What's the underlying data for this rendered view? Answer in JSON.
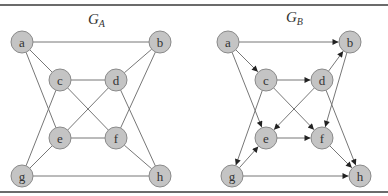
{
  "graphs": [
    {
      "id": "GA",
      "title": "G",
      "title_sub": "A",
      "directed": false,
      "title_pos": [
        88,
        24
      ],
      "nodes": [
        {
          "id": "a",
          "label": "a",
          "x": 22,
          "y": 42
        },
        {
          "id": "b",
          "label": "b",
          "x": 160,
          "y": 42
        },
        {
          "id": "c",
          "label": "c",
          "x": 60,
          "y": 80
        },
        {
          "id": "d",
          "label": "d",
          "x": 116,
          "y": 80
        },
        {
          "id": "e",
          "label": "e",
          "x": 60,
          "y": 138
        },
        {
          "id": "f",
          "label": "f",
          "x": 116,
          "y": 138
        },
        {
          "id": "g",
          "label": "g",
          "x": 22,
          "y": 176
        },
        {
          "id": "h",
          "label": "h",
          "x": 160,
          "y": 176
        }
      ],
      "edges": [
        [
          "a",
          "b"
        ],
        [
          "a",
          "c"
        ],
        [
          "a",
          "e"
        ],
        [
          "b",
          "d"
        ],
        [
          "b",
          "f"
        ],
        [
          "c",
          "d"
        ],
        [
          "c",
          "f"
        ],
        [
          "c",
          "g"
        ],
        [
          "d",
          "e"
        ],
        [
          "d",
          "h"
        ],
        [
          "e",
          "f"
        ],
        [
          "e",
          "g"
        ],
        [
          "f",
          "h"
        ],
        [
          "g",
          "h"
        ]
      ]
    },
    {
      "id": "GB",
      "title": "G",
      "title_sub": "B",
      "directed": true,
      "title_pos": [
        286,
        22
      ],
      "nodes": [
        {
          "id": "a",
          "label": "a",
          "x": 228,
          "y": 42
        },
        {
          "id": "b",
          "label": "b",
          "x": 350,
          "y": 42
        },
        {
          "id": "c",
          "label": "c",
          "x": 266,
          "y": 80
        },
        {
          "id": "d",
          "label": "d",
          "x": 322,
          "y": 80
        },
        {
          "id": "e",
          "label": "e",
          "x": 266,
          "y": 138
        },
        {
          "id": "f",
          "label": "f",
          "x": 322,
          "y": 138
        },
        {
          "id": "g",
          "label": "g",
          "x": 232,
          "y": 176
        },
        {
          "id": "h",
          "label": "h",
          "x": 360,
          "y": 176
        }
      ],
      "edges": [
        [
          "a",
          "b"
        ],
        [
          "a",
          "c"
        ],
        [
          "a",
          "e"
        ],
        [
          "c",
          "d"
        ],
        [
          "c",
          "f"
        ],
        [
          "c",
          "g"
        ],
        [
          "d",
          "b"
        ],
        [
          "d",
          "e"
        ],
        [
          "d",
          "h"
        ],
        [
          "b",
          "f"
        ],
        [
          "e",
          "f"
        ],
        [
          "g",
          "e"
        ],
        [
          "g",
          "h"
        ],
        [
          "f",
          "h"
        ]
      ]
    }
  ],
  "style": {
    "node_radius": 11,
    "node_fill": "#c4c4c4",
    "node_stroke": "#8a8a8a",
    "edge_color": "#777777",
    "arrow_color": "#222222"
  }
}
